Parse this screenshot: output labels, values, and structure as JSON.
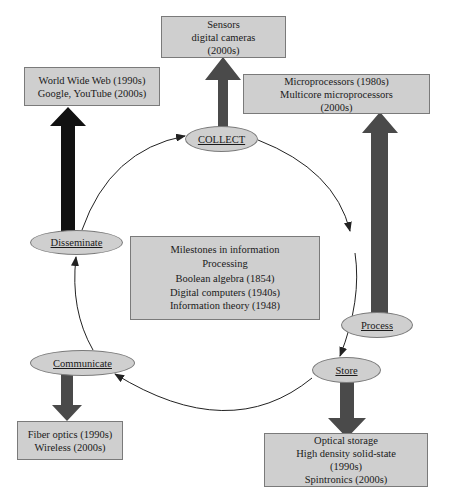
{
  "diagram": {
    "colors": {
      "box_fill": "#cfcfcf",
      "box_border": "#7a7a7a",
      "arrow_dark": "#4a4a4a",
      "arrow_black": "#111111",
      "cycle_line": "#222222"
    },
    "stages": {
      "collect": {
        "label": "COLLECT"
      },
      "process": {
        "label": "Process"
      },
      "store": {
        "label": "Store"
      },
      "communicate": {
        "label": "Communicate"
      },
      "disseminate": {
        "label": "Disseminate"
      }
    },
    "milestone_boxes": {
      "collect": {
        "lines": [
          "Sensors",
          "digital cameras",
          "(2000s)"
        ]
      },
      "process": {
        "lines": [
          "Microprocessors (1980s)",
          "Multicore microprocessors",
          "(2000s)"
        ]
      },
      "store": {
        "lines": [
          "Optical storage",
          "High density solid-state",
          "(1990s)",
          "Spintronics (2000s)"
        ]
      },
      "communicate": {
        "lines": [
          "Fiber optics (1990s)",
          "Wireless (2000s)"
        ]
      },
      "disseminate": {
        "lines": [
          "World Wide Web (1990s)",
          "Google, YouTube (2000s)"
        ]
      }
    },
    "center": {
      "title_line1": "Milestones in information",
      "title_line2": "Processing",
      "items": [
        "Boolean algebra (1854)",
        "Digital computers (1940s)",
        "Information theory (1948)"
      ]
    },
    "cycle_order": [
      "COLLECT",
      "Process",
      "Store",
      "Communicate",
      "Disseminate"
    ]
  }
}
